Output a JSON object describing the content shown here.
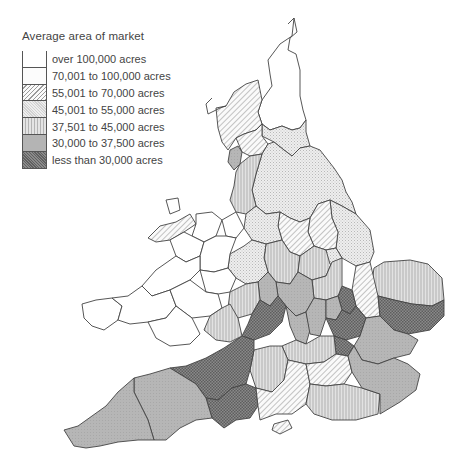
{
  "legend": {
    "title": "Average area of market",
    "items": [
      {
        "label": "over 100,000 acres",
        "class": "c1",
        "fill": "#ffffff"
      },
      {
        "label": "70,001 to 100,000 acres",
        "class": "c2",
        "fill": "#fcfcfc"
      },
      {
        "label": "55,001 to 70,000 acres",
        "class": "c3",
        "fill": "diagonal-hatch-light"
      },
      {
        "label": "45,001 to 55,000 acres",
        "class": "c4",
        "fill": "fine-dot-light"
      },
      {
        "label": "37,501 to 45,000 acres",
        "class": "c5",
        "fill": "vertical-stripes"
      },
      {
        "label": "30,000 to 37,500 acres",
        "class": "c6",
        "fill": "#b4b4b4"
      },
      {
        "label": "less than 30,000 acres",
        "class": "c7",
        "fill": "crosshatch-dark"
      }
    ]
  },
  "map": {
    "title": "England and Wales counties shaded by average area of market"
  }
}
